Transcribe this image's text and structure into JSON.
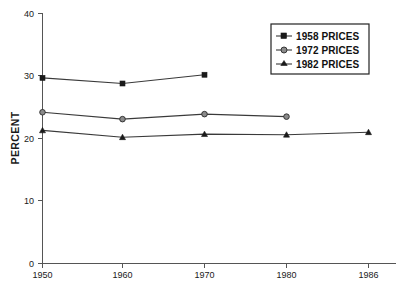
{
  "chart_data": {
    "type": "line",
    "title": "",
    "xlabel": "",
    "ylabel": "PERCENT",
    "x": [
      1950,
      1960,
      1970,
      1980,
      1986
    ],
    "xtick_labels": [
      "1950",
      "1960",
      "1970",
      "1980",
      "1986"
    ],
    "ytick_labels": [
      "0",
      "10",
      "20",
      "30",
      "40"
    ],
    "yticks": [
      0,
      10,
      20,
      30,
      40
    ],
    "ylim": [
      0,
      40
    ],
    "xlim": [
      1950,
      1986
    ],
    "grid": false,
    "legend_position": "top-right",
    "series": [
      {
        "name": "1958 PRICES",
        "marker": "square",
        "x": [
          1950,
          1960,
          1970
        ],
        "values": [
          29.7,
          28.8,
          30.2
        ]
      },
      {
        "name": "1972 PRICES",
        "marker": "circle",
        "x": [
          1950,
          1960,
          1970,
          1980
        ],
        "values": [
          24.2,
          23.1,
          23.9,
          23.5
        ]
      },
      {
        "name": "1982 PRICES",
        "marker": "triangle",
        "x": [
          1950,
          1960,
          1970,
          1980,
          1986
        ],
        "values": [
          21.3,
          20.2,
          20.7,
          20.6,
          21.0
        ]
      }
    ]
  },
  "legend": {
    "items": [
      {
        "label": "1958 PRICES"
      },
      {
        "label": "1972 PRICES"
      },
      {
        "label": "1982 PRICES"
      }
    ]
  },
  "axes": {
    "y_title": "PERCENT",
    "y_tick_0": "0",
    "y_tick_1": "10",
    "y_tick_2": "20",
    "y_tick_3": "30",
    "y_tick_4": "40",
    "x_tick_0": "1950",
    "x_tick_1": "1960",
    "x_tick_2": "1970",
    "x_tick_3": "1980",
    "x_tick_4": "1986"
  },
  "colors": {
    "axis": "#555555",
    "line": "#3a3a3a",
    "text": "#1a1a1a",
    "background": "#ffffff"
  }
}
